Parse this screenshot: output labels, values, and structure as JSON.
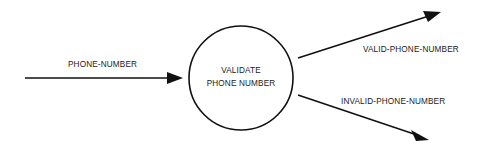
{
  "diagram": {
    "type": "data-flow-diagram",
    "canvas": {
      "width": 501,
      "height": 152,
      "background": "#ffffff"
    },
    "stroke_color": "#111111",
    "text_color": "#1a1a1a",
    "process": {
      "id": "validate-phone-number",
      "shape": "circle",
      "label_line_1": "VALIDATE",
      "label_line_2": "PHONE NUMBER",
      "center_x": 241,
      "center_y": 78,
      "radius": 52
    },
    "flows": [
      {
        "id": "input-phone-number",
        "label": "PHONE-NUMBER",
        "direction": "into-process",
        "label_x": 68,
        "label_y": 65,
        "line": {
          "x1": 25,
          "y1": 78,
          "x2": 177,
          "y2": 78
        },
        "arrow_tip": {
          "x": 183,
          "y": 78
        },
        "arrow_angle_deg": 0
      },
      {
        "id": "output-valid-phone-number",
        "label": "VALID-PHONE-NUMBER",
        "direction": "out-of-process",
        "label_x": 363,
        "label_y": 50,
        "line": {
          "x1": 298,
          "y1": 58,
          "x2": 432,
          "y2": 15
        },
        "arrow_tip": {
          "x": 441,
          "y": 12
        },
        "arrow_angle_deg": -17.8
      },
      {
        "id": "output-invalid-phone-number",
        "label": "INVALID-PHONE-NUMBER",
        "direction": "out-of-process",
        "label_x": 341,
        "label_y": 102,
        "line": {
          "x1": 298,
          "y1": 95,
          "x2": 420,
          "y2": 136
        },
        "arrow_tip": {
          "x": 429,
          "y": 140
        },
        "arrow_angle_deg": 18.6
      }
    ]
  }
}
